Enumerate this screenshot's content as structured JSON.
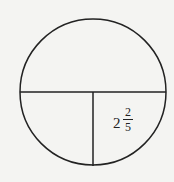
{
  "diagram": {
    "type": "circle-with-diameter-and-radius",
    "label": {
      "whole": "2",
      "numerator": "2",
      "denominator": "5",
      "text": "2 2/5"
    },
    "colors": {
      "stroke": "#222222",
      "background": "#f4f4f2"
    }
  }
}
